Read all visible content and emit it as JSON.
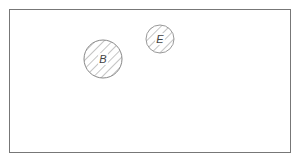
{
  "diagram": {
    "frame": {
      "x": 9,
      "y": 9,
      "width": 282,
      "height": 144,
      "stroke": "#777777"
    },
    "circles": [
      {
        "label": "B",
        "cx": 103,
        "cy": 59,
        "r": 19,
        "fill": "hatched",
        "stroke": "#888888"
      },
      {
        "label": "E",
        "cx": 160,
        "cy": 39,
        "r": 14,
        "fill": "hatched",
        "stroke": "#999999"
      }
    ]
  }
}
